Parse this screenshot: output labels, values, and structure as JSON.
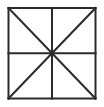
{
  "figure": {
    "name": "square-divided-into-eight-triangles",
    "shape_label": "square",
    "background_color": "#ffffff",
    "line_color": "#2b2b2b",
    "fill_color": "#ffffff",
    "border_stroke_width": 2,
    "inner_stroke_width": 2,
    "diagonal_stroke_width": 2,
    "canvas": {
      "width": 104,
      "height": 107
    },
    "square": {
      "left": 8.5,
      "top": 8.0,
      "right": 95.5,
      "bottom": 98.5,
      "center_x": 52.0,
      "center_y": 53.25
    },
    "segments": [
      {
        "name": "border-top",
        "x1": 8.5,
        "y1": 8.0,
        "x2": 95.5,
        "y2": 8.0
      },
      {
        "name": "border-right",
        "x1": 95.5,
        "y1": 8.0,
        "x2": 95.5,
        "y2": 98.5
      },
      {
        "name": "border-bottom",
        "x1": 95.5,
        "y1": 98.5,
        "x2": 8.5,
        "y2": 98.5
      },
      {
        "name": "border-left",
        "x1": 8.5,
        "y1": 98.5,
        "x2": 8.5,
        "y2": 8.0
      },
      {
        "name": "midline-vertical",
        "x1": 52.0,
        "y1": 8.0,
        "x2": 52.0,
        "y2": 98.5
      },
      {
        "name": "midline-horizontal",
        "x1": 8.5,
        "y1": 53.25,
        "x2": 95.5,
        "y2": 53.25
      },
      {
        "name": "diagonal-tl-br",
        "x1": 8.5,
        "y1": 8.0,
        "x2": 95.5,
        "y2": 98.5
      },
      {
        "name": "diagonal-tr-bl",
        "x1": 95.5,
        "y1": 8.0,
        "x2": 8.5,
        "y2": 98.5
      }
    ],
    "triangle_count": 8
  }
}
